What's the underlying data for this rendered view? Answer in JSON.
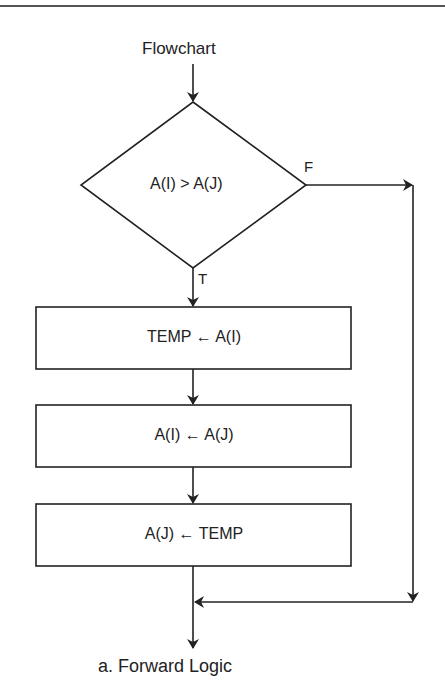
{
  "title": "Flowchart",
  "decision": {
    "condition": "A(I) > A(J)",
    "false_label": "F",
    "true_label": "T"
  },
  "process_steps": [
    {
      "label": "TEMP ← A(I)"
    },
    {
      "label": "A(I) ← A(J)"
    },
    {
      "label": "A(J) ← TEMP"
    }
  ],
  "caption": "a. Forward Logic",
  "colors": {
    "line": "#222222",
    "background": "#ffffff"
  }
}
